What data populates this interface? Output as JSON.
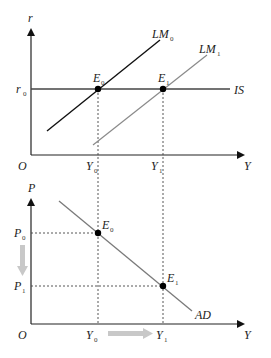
{
  "diagram": {
    "colors": {
      "axis": "#222222",
      "lm0": "#111111",
      "lm1": "#888888",
      "is": "#444444",
      "ad": "#777777",
      "dashed": "#444444",
      "shift_arrow": "#c8c8c8",
      "point": "#000000"
    },
    "upper_panel": {
      "y_axis_label": "r",
      "x_axis_label": "Y",
      "origin_label": "O",
      "r0": {
        "main": "r",
        "sub": "0"
      },
      "y0": {
        "main": "Y",
        "sub": "0"
      },
      "y1": {
        "main": "Y",
        "sub": "1"
      },
      "e0": {
        "main": "E",
        "sub": "0"
      },
      "e1": {
        "main": "E",
        "sub": "1"
      },
      "lm0": {
        "main": "LM",
        "sub": "0"
      },
      "lm1": {
        "main": "LM",
        "sub": "1"
      },
      "is": "IS"
    },
    "lower_panel": {
      "y_axis_label": "P",
      "x_axis_label": "Y",
      "origin_label": "O",
      "p0": {
        "main": "P",
        "sub": "0"
      },
      "p1": {
        "main": "P",
        "sub": "1"
      },
      "y0": {
        "main": "Y",
        "sub": "0"
      },
      "y1": {
        "main": "Y",
        "sub": "1"
      },
      "e0": {
        "main": "E",
        "sub": "0"
      },
      "e1": {
        "main": "E",
        "sub": "1"
      },
      "ad": "AD"
    }
  }
}
